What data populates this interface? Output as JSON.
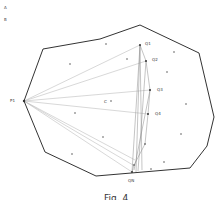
{
  "corner_labels": [
    "A",
    "B"
  ],
  "labels": {
    "p1": "P1",
    "c": "C",
    "q1": "Q1",
    "q2": "Q2",
    "q3": "Q3",
    "q4": "Q4",
    "qn": "QN"
  },
  "caption": "Fig. 4",
  "colors": {
    "polygon": "#333333",
    "rays": "#b8b8b8",
    "chords": "#888888",
    "points": "#333333"
  }
}
